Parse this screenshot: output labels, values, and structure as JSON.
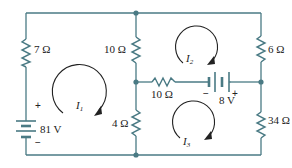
{
  "diagram": {
    "type": "circuit-schematic",
    "colors": {
      "wire": "#4a7a84",
      "text": "#222222",
      "background": "#ffffff"
    },
    "resistors": [
      {
        "id": "R_left",
        "label": "7 Ω",
        "value_ohms": 7,
        "position": "left branch, top"
      },
      {
        "id": "R_mid_top",
        "label": "10 Ω",
        "value_ohms": 10,
        "position": "middle branch, top"
      },
      {
        "id": "R_mid_bottom",
        "label": "4 Ω",
        "value_ohms": 4,
        "position": "middle branch, bottom"
      },
      {
        "id": "R_horizontal",
        "label": "10 Ω",
        "value_ohms": 10,
        "position": "horizontal middle wire"
      },
      {
        "id": "R_right_top",
        "label": "6 Ω",
        "value_ohms": 6,
        "position": "right branch, top"
      },
      {
        "id": "R_right_bottom",
        "label": "34 Ω",
        "value_ohms": 34,
        "position": "right branch, bottom"
      }
    ],
    "sources": [
      {
        "id": "V1",
        "label": "81 V",
        "value_volts": 81,
        "plus": "+",
        "minus": "−",
        "position": "left branch, bottom"
      },
      {
        "id": "V2",
        "label": "8 V",
        "value_volts": 8,
        "plus": "+",
        "minus": "−",
        "position": "horizontal middle wire, right"
      }
    ],
    "mesh_currents": [
      {
        "id": "I1",
        "label": "I",
        "subscript": "1",
        "direction": "clockwise"
      },
      {
        "id": "I2",
        "label": "I",
        "subscript": "2",
        "direction": "clockwise"
      },
      {
        "id": "I3",
        "label": "I",
        "subscript": "3",
        "direction": "clockwise"
      }
    ]
  }
}
